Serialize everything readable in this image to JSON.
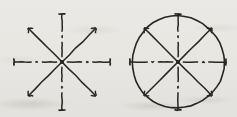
{
  "figure": {
    "background_color": "#f4f3f1",
    "ink_color": "#2a2724",
    "panel_count": 2
  },
  "panels": [
    {
      "id": "left-star",
      "label": "eight-ray vector star",
      "center": {
        "x": 62,
        "y": 62
      },
      "ray_length": 48,
      "has_circle": false,
      "rays": [
        {
          "name": "ray-up",
          "angle_deg": 90,
          "style": "dash-dot",
          "terminator": "cross-tick"
        },
        {
          "name": "ray-upper-right",
          "angle_deg": 45,
          "style": "solid",
          "terminator": "arrow-barb"
        },
        {
          "name": "ray-right",
          "angle_deg": 0,
          "style": "dash-dot",
          "terminator": "cross-tick"
        },
        {
          "name": "ray-lower-right",
          "angle_deg": -45,
          "style": "solid",
          "terminator": "arrow-barb"
        },
        {
          "name": "ray-down",
          "angle_deg": -90,
          "style": "dash-dot",
          "terminator": "cross-tick"
        },
        {
          "name": "ray-lower-left",
          "angle_deg": -135,
          "style": "solid",
          "terminator": "arrow-barb"
        },
        {
          "name": "ray-left",
          "angle_deg": 180,
          "style": "dash-dot",
          "terminator": "cross-tick"
        },
        {
          "name": "ray-upper-left",
          "angle_deg": 135,
          "style": "solid",
          "terminator": "arrow-barb"
        }
      ]
    },
    {
      "id": "right-star-in-circle",
      "label": "eight-ray vector star inscribed in circle",
      "center": {
        "x": 178,
        "y": 62
      },
      "ray_length": 48,
      "circle_radius": 46,
      "has_circle": true,
      "rays": [
        {
          "name": "ray-up",
          "angle_deg": 90,
          "style": "dash-dot",
          "terminator": "cross-tick"
        },
        {
          "name": "ray-upper-right",
          "angle_deg": 45,
          "style": "solid",
          "terminator": "arrow-barb"
        },
        {
          "name": "ray-right",
          "angle_deg": 0,
          "style": "dash-dot",
          "terminator": "cross-tick"
        },
        {
          "name": "ray-lower-right",
          "angle_deg": -45,
          "style": "solid",
          "terminator": "arrow-barb"
        },
        {
          "name": "ray-down",
          "angle_deg": -90,
          "style": "dash-dot",
          "terminator": "cross-tick"
        },
        {
          "name": "ray-lower-left",
          "angle_deg": -135,
          "style": "solid",
          "terminator": "arrow-barb"
        },
        {
          "name": "ray-left",
          "angle_deg": 180,
          "style": "dash-dot",
          "terminator": "cross-tick"
        },
        {
          "name": "ray-upper-left",
          "angle_deg": 135,
          "style": "solid",
          "terminator": "arrow-barb"
        }
      ]
    }
  ]
}
